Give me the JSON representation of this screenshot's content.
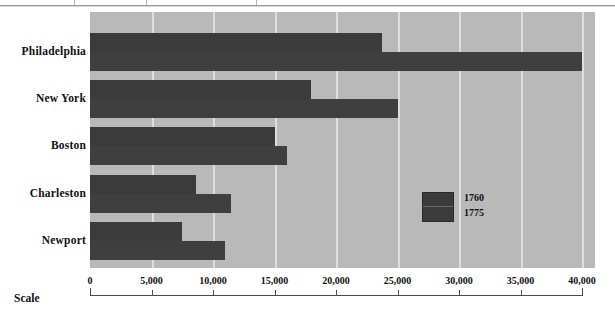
{
  "chart_data": {
    "type": "bar",
    "orientation": "horizontal",
    "title": "",
    "xlabel": "Scale",
    "ylabel": "",
    "categories": [
      "Philadelphia",
      "New York",
      "Boston",
      "Charleston",
      "Newport"
    ],
    "series": [
      {
        "name": "1760",
        "values": [
          23750,
          18000,
          15000,
          8600,
          7500
        ]
      },
      {
        "name": "1775",
        "values": [
          40000,
          25000,
          16000,
          11500,
          11000
        ]
      }
    ],
    "xlim": [
      0,
      40000
    ],
    "xticks": [
      0,
      5000,
      10000,
      15000,
      20000,
      25000,
      30000,
      35000,
      40000
    ],
    "xtick_labels": [
      "0",
      "5,000",
      "10,000",
      "15,000",
      "20,000",
      "25,000",
      "30,000",
      "35,000",
      "40,000"
    ],
    "grid": true,
    "legend": {
      "position": "inside-right",
      "entries": [
        "1760",
        "1775"
      ]
    },
    "colors": {
      "bar": "#3b3b3b",
      "plot_background": "#b9b9b9",
      "gridline": "#e4e4e4",
      "axis": "#4a4a4a",
      "text": "#111111"
    }
  },
  "axis": {
    "scale_label": "Scale"
  },
  "legend": {
    "entry_top": "1760",
    "entry_bottom": "1775"
  }
}
